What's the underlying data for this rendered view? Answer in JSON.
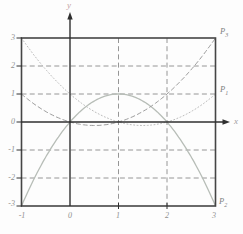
{
  "figure": {
    "x_axis_label": "x",
    "y_axis_label": "y",
    "x_tick_labels": [
      "-1",
      "0",
      "1",
      "2",
      "3"
    ],
    "y_tick_labels": [
      "3",
      "2",
      "1",
      "0",
      "-1",
      "-2",
      "-3"
    ],
    "point_labels": [
      {
        "text": "P",
        "sub": "3"
      },
      {
        "text": "P",
        "sub": "1"
      },
      {
        "text": "P",
        "sub": "2"
      }
    ]
  },
  "chart_data": {
    "type": "line",
    "title": "",
    "xlabel": "x",
    "ylabel": "y",
    "xlim": [
      -1,
      3
    ],
    "ylim": [
      -3,
      3
    ],
    "x_ticks": [
      -1,
      0,
      1,
      2,
      3
    ],
    "y_ticks": [
      -3,
      -2,
      -1,
      0,
      1,
      2,
      3
    ],
    "grid": {
      "style": "dashed",
      "vertical_at": [
        1,
        2
      ],
      "horizontal_at": [
        -2,
        -1,
        1,
        2
      ],
      "color": "#8a8a8a"
    },
    "frame_color": "#454545",
    "axis_color": "#2f2f2f",
    "series": [
      {
        "name": "P1",
        "equation": "y = (x-1)(x-2)/2",
        "coeffs": [
          1,
          -1.5,
          0.5
        ],
        "style": "dotted",
        "color": "#bcbcbc",
        "key_points": [
          [
            -1,
            3
          ],
          [
            0,
            1
          ],
          [
            1,
            0
          ],
          [
            1.5,
            -0.125
          ],
          [
            2,
            0
          ],
          [
            3,
            1
          ]
        ],
        "label_at": [
          3,
          1
        ]
      },
      {
        "name": "P2",
        "equation": "y = x(2-x)",
        "coeffs": [
          0,
          2,
          -1
        ],
        "style": "solid",
        "color": "#b7bdb7",
        "key_points": [
          [
            -1,
            -3
          ],
          [
            0,
            0
          ],
          [
            1,
            1
          ],
          [
            2,
            0
          ],
          [
            3,
            -3
          ]
        ],
        "label_at": [
          3,
          -3
        ]
      },
      {
        "name": "P3",
        "equation": "y = x(x-1)/2",
        "coeffs": [
          0,
          -0.5,
          0.5
        ],
        "style": "dashed",
        "color": "#9d9d9d",
        "key_points": [
          [
            -1,
            1
          ],
          [
            0,
            0
          ],
          [
            0.5,
            -0.125
          ],
          [
            1,
            0
          ],
          [
            2,
            1
          ],
          [
            3,
            3
          ]
        ],
        "label_at": [
          3,
          3
        ]
      }
    ]
  }
}
